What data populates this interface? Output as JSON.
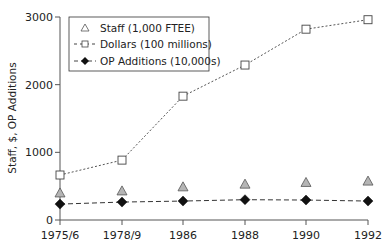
{
  "chart_data": {
    "type": "line",
    "title": "",
    "xlabel": "",
    "ylabel": "Staff, $, OP Additions",
    "categories": [
      "1975/6",
      "1978/9",
      "1986",
      "1988",
      "1990",
      "1992"
    ],
    "ylim": [
      0,
      3000
    ],
    "yticks": [
      0,
      1000,
      2000,
      3000
    ],
    "grid": false,
    "legend_position": "upper-left",
    "series": [
      {
        "name": "Staff (1,000 FTEE)",
        "marker": "triangle",
        "line": "none",
        "color": "#999999",
        "values": [
          400,
          430,
          490,
          530,
          555,
          575
        ]
      },
      {
        "name": "Dollars (100 millions)",
        "marker": "open-square",
        "line": "dotted",
        "color": "#555555",
        "values": [
          665,
          885,
          1830,
          2290,
          2820,
          2960
        ]
      },
      {
        "name": "OP Additions (10,000s)",
        "marker": "filled-diamond",
        "line": "dashed",
        "color": "#111111",
        "values": [
          235,
          265,
          280,
          300,
          295,
          280
        ]
      }
    ]
  }
}
